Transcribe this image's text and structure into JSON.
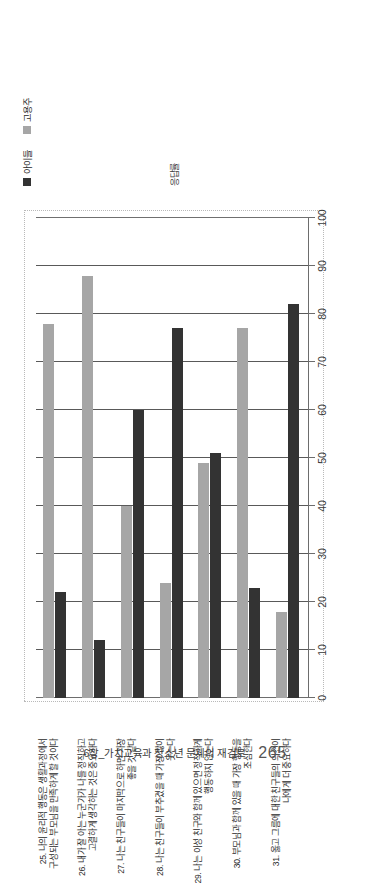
{
  "page": {
    "footer_text": "6장_가치교육과 청소년 문제의 재검토",
    "page_number": "265"
  },
  "legend": {
    "items": [
      {
        "label": "아이들",
        "color": "#333333",
        "key": "children"
      },
      {
        "label": "고용주",
        "color": "#a6a6a6",
        "key": "employers"
      }
    ]
  },
  "chart_data": {
    "type": "bar",
    "orientation": "vertical",
    "title": "",
    "subtitle": "",
    "xlabel": "",
    "ylabel": "응답률",
    "ylim": [
      0,
      100
    ],
    "yticks": [
      "0",
      "10",
      "20",
      "30",
      "40",
      "50",
      "60",
      "70",
      "80",
      "90",
      "100"
    ],
    "grid": true,
    "legend_position": "top-right",
    "categories": [
      "25. 나의 윤리적 행동은 생활과정에서 구성되는 부모님을 만족하게 할 것이다",
      "26. 내가 잘 아는 누군가가 나를 정직하고 고결하게 생각하는 것은 중요하다",
      "27. 나는 친구들이 마지막으로 하면 가장 좋을 것 같다",
      "28. 나는 친구들이 부추겼을 때 가장 많이 웃는다",
      "29. 나는 이성 친구와 함께 있으면 정직하게 행동하지 않는다",
      "30. 부모님과 함께 있을 때 가장 행동을 조심한다",
      "31. 옳고 그름에 대한 친구들의 의견이 나에게 더 중요하다"
    ],
    "series": [
      {
        "name": "고용주",
        "color": "#a6a6a6",
        "values": [
          78,
          88,
          40,
          24,
          49,
          77,
          18
        ]
      },
      {
        "name": "아이들",
        "color": "#333333",
        "values": [
          22,
          12,
          60,
          77,
          51,
          23,
          82
        ]
      }
    ]
  }
}
